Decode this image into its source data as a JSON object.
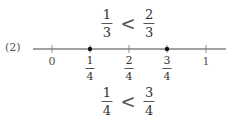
{
  "problem_label": "(2)",
  "top_inequality": {
    "left": {
      "numerator": "1",
      "denominator": "3"
    },
    "operator": "<",
    "right": {
      "numerator": "2",
      "denominator": "3"
    }
  },
  "number_line": {
    "ticks": [
      {
        "label": "0",
        "type": "integer"
      },
      {
        "numerator": "1",
        "denominator": "4",
        "type": "fraction",
        "marked": true
      },
      {
        "numerator": "2",
        "denominator": "4",
        "type": "fraction",
        "marked": false
      },
      {
        "numerator": "3",
        "denominator": "4",
        "type": "fraction",
        "marked": true
      },
      {
        "label": "1",
        "type": "integer"
      }
    ],
    "line_color": "#333333",
    "point_color": "#111111"
  },
  "bottom_inequality": {
    "left": {
      "numerator": "1",
      "denominator": "4"
    },
    "operator": "<",
    "right": {
      "numerator": "3",
      "denominator": "4"
    }
  }
}
